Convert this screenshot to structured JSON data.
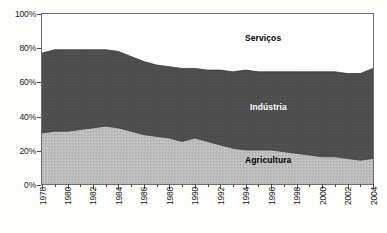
{
  "chart_data": {
    "type": "area",
    "stacked": true,
    "title": "",
    "subtitle": "",
    "xlabel": "",
    "ylabel": "",
    "ylim": [
      0,
      100
    ],
    "ytick_labels": [
      "0%",
      "20%",
      "40%",
      "60%",
      "80%",
      "100%"
    ],
    "ytick_values": [
      0,
      20,
      40,
      60,
      80,
      100
    ],
    "grid": false,
    "legend_position": "inline-annotations",
    "x": [
      1978,
      1979,
      1980,
      1981,
      1982,
      1983,
      1984,
      1985,
      1986,
      1987,
      1988,
      1989,
      1990,
      1991,
      1992,
      1993,
      1994,
      1995,
      1996,
      1997,
      1998,
      1999,
      2000,
      2001,
      2002,
      2003,
      2004
    ],
    "xtick_labels": [
      "1978",
      "1980",
      "1982",
      "1984",
      "1986",
      "1988",
      "1990",
      "1992",
      "1994",
      "1996",
      "1998",
      "2000",
      "2002",
      "2004"
    ],
    "xtick_values": [
      1978,
      1980,
      1982,
      1984,
      1986,
      1988,
      1990,
      1992,
      1994,
      1996,
      1998,
      2000,
      2002,
      2004
    ],
    "series": [
      {
        "name": "Agricultura",
        "color": "#b8b8b8",
        "values": [
          30,
          31,
          31,
          32,
          33,
          34,
          33,
          31,
          29,
          28,
          27,
          25,
          27,
          25,
          23,
          21,
          20,
          20,
          20,
          19,
          18,
          17,
          16,
          16,
          15,
          14,
          15
        ]
      },
      {
        "name": "Indústria",
        "color": "#4d4d4d",
        "values": [
          47,
          48,
          48,
          47,
          46,
          45,
          45,
          44,
          43,
          42,
          42,
          43,
          41,
          42,
          44,
          45,
          47,
          46,
          46,
          47,
          48,
          49,
          50,
          50,
          50,
          51,
          53
        ]
      },
      {
        "name": "Serviços",
        "color": "#ffffff",
        "values": [
          23,
          21,
          21,
          21,
          21,
          21,
          22,
          25,
          28,
          30,
          31,
          32,
          32,
          33,
          33,
          34,
          33,
          34,
          34,
          34,
          34,
          34,
          34,
          34,
          35,
          35,
          32
        ]
      }
    ],
    "boundaries": {
      "agriculture_top": [
        30,
        31,
        31,
        32,
        33,
        34,
        33,
        31,
        29,
        28,
        27,
        25,
        27,
        25,
        23,
        21,
        20,
        20,
        20,
        19,
        18,
        17,
        16,
        16,
        15,
        14,
        15
      ],
      "industry_top": [
        77,
        79,
        79,
        79,
        79,
        79,
        78,
        75,
        72,
        70,
        69,
        68,
        68,
        67,
        67,
        66,
        67,
        66,
        66,
        66,
        66,
        66,
        66,
        66,
        65,
        65,
        68
      ]
    },
    "annotations": [
      {
        "text": "Serviços",
        "x": 1992,
        "y": 84,
        "style": "dark-on-light"
      },
      {
        "text": "Indústria",
        "x": 1996,
        "y": 46,
        "style": "light-on-dark"
      },
      {
        "text": "Agricultura",
        "x": 1996,
        "y": 12,
        "style": "dark-on-light"
      }
    ]
  },
  "colors": {
    "agriculture": "#b8b8b8",
    "industry": "#4d4d4d",
    "services": "#ffffff",
    "frame": "#6e6e6e",
    "text": "#1a1a1a",
    "background": "#fdfdfb"
  }
}
